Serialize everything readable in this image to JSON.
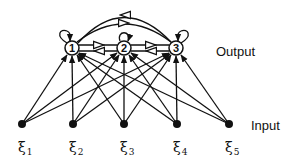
{
  "diagram": {
    "title": "",
    "layers": {
      "output": {
        "label": "Output",
        "nodes": [
          {
            "id": "1",
            "label": "1"
          },
          {
            "id": "2",
            "label": "2"
          },
          {
            "id": "3",
            "label": "3"
          }
        ]
      },
      "input": {
        "label": "Input",
        "nodes": [
          {
            "id": "xi1",
            "symbol": "ξ",
            "subscript": "1"
          },
          {
            "id": "xi2",
            "symbol": "ξ",
            "subscript": "2"
          },
          {
            "id": "xi3",
            "symbol": "ξ",
            "subscript": "3"
          },
          {
            "id": "xi4",
            "symbol": "ξ",
            "subscript": "4"
          },
          {
            "id": "xi5",
            "symbol": "ξ",
            "subscript": "5"
          }
        ]
      }
    },
    "edges": {
      "feedforward": "every input connects to every output node",
      "lateral": [
        "1->2",
        "2->1",
        "2->3",
        "3->2",
        "1->3",
        "3->1"
      ],
      "self_loops": [
        "1",
        "2",
        "3"
      ]
    },
    "colors": {
      "line": "#111111",
      "background": "#ffffff"
    }
  }
}
